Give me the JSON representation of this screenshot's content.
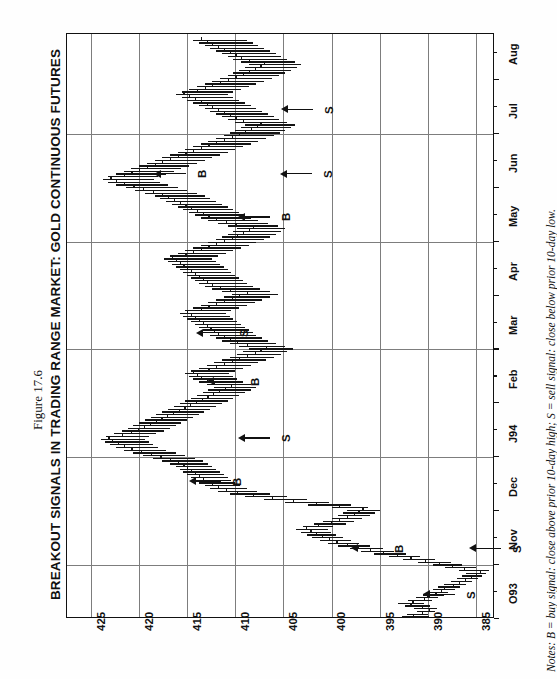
{
  "figure": {
    "number": "Figure 17.6",
    "title": "BREAKOUT SIGNALS IN TRADING RANGE MARKET: GOLD CONTINUOUS FUTURES",
    "notes": "Notes: B = buy signal: close above prior 10-day high; S = sell signal: close below prior 10-day low."
  },
  "chart_data": {
    "type": "bar",
    "title": "BREAKOUT SIGNALS IN TRADING RANGE MARKET: GOLD CONTINUOUS FUTURES",
    "subtitle": "Figure 17.6",
    "xlabel": "",
    "ylabel": "",
    "orientation": "rotated-90",
    "grid": true,
    "legend": "none",
    "price_axis": {
      "name": "Price",
      "ticks": [
        "425",
        "420",
        "415",
        "410",
        "405",
        "400",
        "395",
        "390",
        "385"
      ],
      "values": [
        425,
        420,
        415,
        410,
        405,
        400,
        395,
        390,
        385
      ],
      "range": [
        383,
        427.5
      ],
      "direction": "decreasing-left-to-right"
    },
    "time_axis": {
      "name": "Date",
      "ticks": [
        "O93",
        "Nov",
        "Dec",
        "J94",
        "Feb",
        "Mar",
        "Apr",
        "May",
        "Jun",
        "Jul",
        "Aug"
      ],
      "range": [
        "O93",
        "Aug"
      ],
      "direction": "bottom-to-top"
    },
    "signals": [
      {
        "label": "S",
        "type": "sell",
        "month": "O93",
        "price": 390.4
      },
      {
        "label": "B",
        "type": "buy",
        "month": "Nov",
        "price": 397.9
      },
      {
        "label": "S",
        "type": "sell",
        "month": "Nov",
        "price": 385.6
      },
      {
        "label": "B",
        "type": "buy",
        "month": "Dec",
        "price": 414.7
      },
      {
        "label": "S",
        "type": "sell",
        "month": "J94",
        "price": 409.6
      },
      {
        "label": "B",
        "type": "buy",
        "month": "Feb",
        "price": 412.8
      },
      {
        "label": "S",
        "type": "sell",
        "month": "Mar",
        "price": 414.0
      },
      {
        "label": "B",
        "type": "buy",
        "month": "May",
        "price": 409.6
      },
      {
        "label": "S",
        "type": "sell",
        "month": "Jun",
        "price": 405.3
      },
      {
        "label": "B",
        "type": "buy",
        "month": "Jun",
        "price": 418.4
      },
      {
        "label": "S",
        "type": "sell",
        "month": "Jul",
        "price": 405.2
      }
    ],
    "series": [
      {
        "name": "Gold Continuous Futures (OHLC daily bars)",
        "bars": [
          [
            389.9,
            392.7,
            391.5
          ],
          [
            390.0,
            392.2,
            390.6
          ],
          [
            389.2,
            391.1,
            389.9
          ],
          [
            389.0,
            391.4,
            390.6
          ],
          [
            389.8,
            392.4,
            391.8
          ],
          [
            390.4,
            393.1,
            391.6
          ],
          [
            389.5,
            392.0,
            390.4
          ],
          [
            388.9,
            391.2,
            390.1
          ],
          [
            388.3,
            390.5,
            389.2
          ],
          [
            387.9,
            390.0,
            388.6
          ],
          [
            387.2,
            389.4,
            388.3
          ],
          [
            386.6,
            388.9,
            387.4
          ],
          [
            386.0,
            388.3,
            386.8
          ],
          [
            385.4,
            387.6,
            386.1
          ],
          [
            384.8,
            387.0,
            385.5
          ],
          [
            384.3,
            386.4,
            385.0
          ],
          [
            383.9,
            386.0,
            384.6
          ],
          [
            383.6,
            386.8,
            386.2
          ],
          [
            385.0,
            388.2,
            387.5
          ],
          [
            386.4,
            389.5,
            388.8
          ],
          [
            387.6,
            391.0,
            390.3
          ],
          [
            389.2,
            392.6,
            391.8
          ],
          [
            390.8,
            394.0,
            393.2
          ],
          [
            392.2,
            395.6,
            394.7
          ],
          [
            393.5,
            396.9,
            396.0
          ],
          [
            394.8,
            398.1,
            397.3
          ],
          [
            396.0,
            399.3,
            398.4
          ],
          [
            397.1,
            400.4,
            399.5
          ],
          [
            398.0,
            401.2,
            400.3
          ],
          [
            398.8,
            402.0,
            401.0
          ],
          [
            399.5,
            402.6,
            401.6
          ],
          [
            400.0,
            403.2,
            402.2
          ],
          [
            400.4,
            403.7,
            402.7
          ],
          [
            399.8,
            403.0,
            401.4
          ],
          [
            398.5,
            401.8,
            400.1
          ],
          [
            397.6,
            400.9,
            399.2
          ],
          [
            396.8,
            400.0,
            398.4
          ],
          [
            396.0,
            399.3,
            397.7
          ],
          [
            395.5,
            398.8,
            397.2
          ],
          [
            395.0,
            398.4,
            396.8
          ],
          [
            396.2,
            400.0,
            399.2
          ],
          [
            398.0,
            402.4,
            401.6
          ],
          [
            400.2,
            404.8,
            404.0
          ],
          [
            402.5,
            407.0,
            406.2
          ],
          [
            404.6,
            409.0,
            408.2
          ],
          [
            406.4,
            410.6,
            409.8
          ],
          [
            407.8,
            411.8,
            411.0
          ],
          [
            408.8,
            412.6,
            411.8
          ],
          [
            409.5,
            413.2,
            412.4
          ],
          [
            410.0,
            413.8,
            412.9
          ],
          [
            410.4,
            414.2,
            413.4
          ],
          [
            410.8,
            414.6,
            413.8
          ],
          [
            411.2,
            415.0,
            414.2
          ],
          [
            411.6,
            415.4,
            414.6
          ],
          [
            412.0,
            415.8,
            415.0
          ],
          [
            412.4,
            416.2,
            415.4
          ],
          [
            412.8,
            416.8,
            416.0
          ],
          [
            413.4,
            417.6,
            416.8
          ],
          [
            414.2,
            418.6,
            417.8
          ],
          [
            415.2,
            419.6,
            418.8
          ],
          [
            416.2,
            420.6,
            419.8
          ],
          [
            417.2,
            421.6,
            420.8
          ],
          [
            418.0,
            422.4,
            421.6
          ],
          [
            418.6,
            423.0,
            422.2
          ],
          [
            419.0,
            423.6,
            422.8
          ],
          [
            419.4,
            424.0,
            423.2
          ],
          [
            419.0,
            423.4,
            421.8
          ],
          [
            418.2,
            422.6,
            420.9
          ],
          [
            417.4,
            421.8,
            420.1
          ],
          [
            416.8,
            421.2,
            419.5
          ],
          [
            416.2,
            420.6,
            418.9
          ],
          [
            415.6,
            420.0,
            418.3
          ],
          [
            415.0,
            419.4,
            417.7
          ],
          [
            414.4,
            418.8,
            417.1
          ],
          [
            413.8,
            418.2,
            416.5
          ],
          [
            413.2,
            417.6,
            415.9
          ],
          [
            412.6,
            417.0,
            415.3
          ],
          [
            412.0,
            416.4,
            414.7
          ],
          [
            411.4,
            415.8,
            414.1
          ],
          [
            410.8,
            415.2,
            413.5
          ],
          [
            410.2,
            414.6,
            412.9
          ],
          [
            409.6,
            414.0,
            412.3
          ],
          [
            409.0,
            413.4,
            411.7
          ],
          [
            408.4,
            412.8,
            411.1
          ],
          [
            407.8,
            412.2,
            410.5
          ],
          [
            408.4,
            413.0,
            412.2
          ],
          [
            409.2,
            413.8,
            413.0
          ],
          [
            409.8,
            414.4,
            413.6
          ],
          [
            410.2,
            414.8,
            414.0
          ],
          [
            410.6,
            415.2,
            414.4
          ],
          [
            410.0,
            414.6,
            412.8
          ],
          [
            409.2,
            413.8,
            412.0
          ],
          [
            408.4,
            413.0,
            411.2
          ],
          [
            407.6,
            412.2,
            410.4
          ],
          [
            406.8,
            411.4,
            409.6
          ],
          [
            406.0,
            410.6,
            408.8
          ],
          [
            405.2,
            409.8,
            408.0
          ],
          [
            404.6,
            409.2,
            407.4
          ],
          [
            404.0,
            408.6,
            406.8
          ],
          [
            404.8,
            409.6,
            408.8
          ],
          [
            405.8,
            410.6,
            409.8
          ],
          [
            406.6,
            411.4,
            410.6
          ],
          [
            407.2,
            412.0,
            411.2
          ],
          [
            407.8,
            412.6,
            411.8
          ],
          [
            408.2,
            413.0,
            412.2
          ],
          [
            408.6,
            413.4,
            412.6
          ],
          [
            409.0,
            413.8,
            413.0
          ],
          [
            409.4,
            414.2,
            413.4
          ],
          [
            409.8,
            414.6,
            413.8
          ],
          [
            410.2,
            415.0,
            414.2
          ],
          [
            410.6,
            415.4,
            414.6
          ],
          [
            411.0,
            415.8,
            415.0
          ],
          [
            410.4,
            415.2,
            413.6
          ],
          [
            409.6,
            414.4,
            412.8
          ],
          [
            408.8,
            413.6,
            412.0
          ],
          [
            408.0,
            412.8,
            411.2
          ],
          [
            407.2,
            412.0,
            410.4
          ],
          [
            406.4,
            411.2,
            409.6
          ],
          [
            405.6,
            410.4,
            408.8
          ],
          [
            406.4,
            411.4,
            410.6
          ],
          [
            407.4,
            412.4,
            411.6
          ],
          [
            408.2,
            413.2,
            412.4
          ],
          [
            408.8,
            413.8,
            413.0
          ],
          [
            409.2,
            414.2,
            413.4
          ],
          [
            409.6,
            414.6,
            413.8
          ],
          [
            410.0,
            415.0,
            414.2
          ],
          [
            410.4,
            415.4,
            414.6
          ],
          [
            410.8,
            415.8,
            415.0
          ],
          [
            411.2,
            416.2,
            415.4
          ],
          [
            411.6,
            416.6,
            415.8
          ],
          [
            412.0,
            417.0,
            416.2
          ],
          [
            412.4,
            417.4,
            416.6
          ],
          [
            411.8,
            416.8,
            415.2
          ],
          [
            411.0,
            416.0,
            414.4
          ],
          [
            410.2,
            415.2,
            413.6
          ],
          [
            409.4,
            414.4,
            412.8
          ],
          [
            408.6,
            413.6,
            412.0
          ],
          [
            407.8,
            412.8,
            411.2
          ],
          [
            407.0,
            412.0,
            410.4
          ],
          [
            406.4,
            411.4,
            409.8
          ],
          [
            405.8,
            410.8,
            409.2
          ],
          [
            405.2,
            410.2,
            408.6
          ],
          [
            404.8,
            409.8,
            408.2
          ],
          [
            405.6,
            410.8,
            410.0
          ],
          [
            406.6,
            411.8,
            411.0
          ],
          [
            407.6,
            412.8,
            412.0
          ],
          [
            408.4,
            413.6,
            412.8
          ],
          [
            409.0,
            414.2,
            413.4
          ],
          [
            409.6,
            414.8,
            414.0
          ],
          [
            410.2,
            415.4,
            414.6
          ],
          [
            410.8,
            416.0,
            415.2
          ],
          [
            411.4,
            416.6,
            415.8
          ],
          [
            412.0,
            417.2,
            416.4
          ],
          [
            412.6,
            417.8,
            417.0
          ],
          [
            413.2,
            418.4,
            417.6
          ],
          [
            414.0,
            419.4,
            418.6
          ],
          [
            415.0,
            420.4,
            419.6
          ],
          [
            416.0,
            421.4,
            420.6
          ],
          [
            417.0,
            422.4,
            421.6
          ],
          [
            417.8,
            423.2,
            422.4
          ],
          [
            418.4,
            423.8,
            423.0
          ],
          [
            418.0,
            423.2,
            421.6
          ],
          [
            417.2,
            422.4,
            420.8
          ],
          [
            416.4,
            421.6,
            420.0
          ],
          [
            415.6,
            420.8,
            419.2
          ],
          [
            414.8,
            420.0,
            418.4
          ],
          [
            414.0,
            419.2,
            417.6
          ],
          [
            413.2,
            418.4,
            416.8
          ],
          [
            412.4,
            417.6,
            416.0
          ],
          [
            411.6,
            416.8,
            415.2
          ],
          [
            410.8,
            416.0,
            414.4
          ],
          [
            410.0,
            415.2,
            413.6
          ],
          [
            409.2,
            414.4,
            412.8
          ],
          [
            408.4,
            413.6,
            412.0
          ],
          [
            407.6,
            412.8,
            411.2
          ],
          [
            406.8,
            412.0,
            410.4
          ],
          [
            406.0,
            411.2,
            409.6
          ],
          [
            405.4,
            410.6,
            409.0
          ],
          [
            404.8,
            410.0,
            408.4
          ],
          [
            404.2,
            409.4,
            407.8
          ],
          [
            403.8,
            409.0,
            407.4
          ],
          [
            404.6,
            410.0,
            409.2
          ],
          [
            405.4,
            410.8,
            410.0
          ],
          [
            406.0,
            411.4,
            410.6
          ],
          [
            406.6,
            412.0,
            411.2
          ],
          [
            407.2,
            412.6,
            411.8
          ],
          [
            407.8,
            413.2,
            412.4
          ],
          [
            408.4,
            413.8,
            413.0
          ],
          [
            409.0,
            414.4,
            413.6
          ],
          [
            409.6,
            415.0,
            414.2
          ],
          [
            410.2,
            415.6,
            414.8
          ],
          [
            410.8,
            416.2,
            415.4
          ],
          [
            410.2,
            415.6,
            414.0
          ],
          [
            409.4,
            414.8,
            413.2
          ],
          [
            408.6,
            414.0,
            412.4
          ],
          [
            407.8,
            413.2,
            411.6
          ],
          [
            407.0,
            412.4,
            410.8
          ],
          [
            406.2,
            411.6,
            410.0
          ],
          [
            405.4,
            410.8,
            409.2
          ],
          [
            404.8,
            410.2,
            408.6
          ],
          [
            404.2,
            409.6,
            408.0
          ],
          [
            403.6,
            409.0,
            407.4
          ],
          [
            403.2,
            408.6,
            407.0
          ],
          [
            403.8,
            409.4,
            408.6
          ],
          [
            404.6,
            410.2,
            409.4
          ],
          [
            405.2,
            410.8,
            410.0
          ],
          [
            405.8,
            411.4,
            410.6
          ],
          [
            406.4,
            412.0,
            411.2
          ],
          [
            407.0,
            412.6,
            411.8
          ],
          [
            407.6,
            413.2,
            412.4
          ],
          [
            408.2,
            413.8,
            413.0
          ],
          [
            408.8,
            414.4,
            413.6
          ]
        ]
      }
    ]
  }
}
